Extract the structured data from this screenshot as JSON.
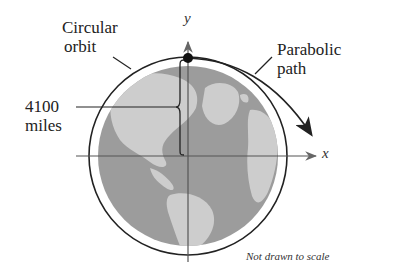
{
  "labels": {
    "circular_orbit": [
      "Circular",
      "orbit"
    ],
    "parabolic_path": [
      "Parabolic",
      "path"
    ],
    "distance": [
      "4100",
      "miles"
    ],
    "x_axis": "x",
    "y_axis": "y",
    "note": "Not drawn to scale"
  },
  "colors": {
    "ocean": "#9c9c9c",
    "land": "#cdcdcd",
    "lines": "#222222",
    "axis": "#555555"
  },
  "geometry": {
    "center": [
      188,
      156
    ],
    "earth_radius": 90,
    "orbit_radius": 99,
    "satellite_position": [
      188,
      58
    ]
  }
}
